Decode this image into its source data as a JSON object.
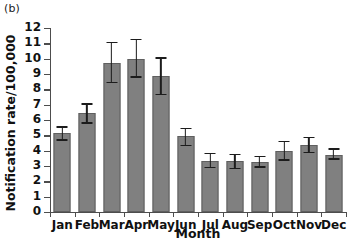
{
  "figure": {
    "panel_label": "(b)",
    "background_color": "#ffffff"
  },
  "chart_data": {
    "type": "bar",
    "title": "",
    "subtitle": "",
    "panel": "(b)",
    "categories": [
      "Jan",
      "Feb",
      "Mar",
      "Apr",
      "May",
      "Jun",
      "Jul",
      "Aug",
      "Sep",
      "Oct",
      "Nov",
      "Dec"
    ],
    "values": [
      5.15,
      6.45,
      9.75,
      10.0,
      8.85,
      4.95,
      3.35,
      3.3,
      3.25,
      4.0,
      4.35,
      3.75
    ],
    "error_low": [
      4.65,
      5.75,
      8.4,
      8.75,
      7.6,
      4.3,
      2.85,
      2.8,
      2.9,
      3.35,
      3.85,
      3.4
    ],
    "error_high": [
      5.6,
      7.1,
      11.1,
      11.3,
      10.1,
      5.5,
      3.85,
      3.8,
      3.65,
      4.65,
      4.9,
      4.15
    ],
    "xlabel": "Month",
    "ylabel": "Notification rate/100,000",
    "ylim": [
      0,
      12
    ],
    "yticks": [
      0,
      1,
      2,
      3,
      4,
      5,
      6,
      7,
      8,
      9,
      10,
      11,
      12
    ],
    "ytick_labels": [
      "0",
      "1",
      "2",
      "3",
      "4",
      "5",
      "6",
      "7",
      "8",
      "9",
      "10",
      "11",
      "12"
    ],
    "grid": false,
    "legend": null,
    "legend_position": "none",
    "bar_color": "#808080",
    "bar_edge_color": "#5f5f5f",
    "error_bar_color": "#1c1c1c",
    "axis_color": "#4d4d4d"
  }
}
